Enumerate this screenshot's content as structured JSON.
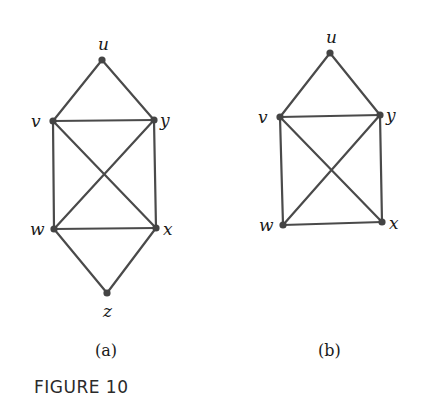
{
  "figure": {
    "caption": "FIGURE 10",
    "graphs": [
      {
        "id": "a",
        "label": "(a)",
        "vertices": [
          {
            "name": "u",
            "x": 102,
            "y": 60
          },
          {
            "name": "v",
            "x": 53,
            "y": 121
          },
          {
            "name": "y",
            "x": 154,
            "y": 120
          },
          {
            "name": "w",
            "x": 54,
            "y": 229
          },
          {
            "name": "x",
            "x": 156,
            "y": 228
          },
          {
            "name": "z",
            "x": 107,
            "y": 293
          }
        ],
        "edges": [
          [
            "u",
            "v"
          ],
          [
            "u",
            "y"
          ],
          [
            "v",
            "y"
          ],
          [
            "v",
            "w"
          ],
          [
            "v",
            "x"
          ],
          [
            "y",
            "w"
          ],
          [
            "y",
            "x"
          ],
          [
            "w",
            "x"
          ],
          [
            "w",
            "z"
          ],
          [
            "x",
            "z"
          ]
        ]
      },
      {
        "id": "b",
        "label": "(b)",
        "vertices": [
          {
            "name": "u",
            "x": 330,
            "y": 53
          },
          {
            "name": "v",
            "x": 280,
            "y": 117
          },
          {
            "name": "y",
            "x": 380,
            "y": 115
          },
          {
            "name": "w",
            "x": 283,
            "y": 225
          },
          {
            "name": "x",
            "x": 382,
            "y": 222
          }
        ],
        "edges": [
          [
            "u",
            "v"
          ],
          [
            "u",
            "y"
          ],
          [
            "v",
            "y"
          ],
          [
            "v",
            "w"
          ],
          [
            "v",
            "x"
          ],
          [
            "y",
            "w"
          ],
          [
            "y",
            "x"
          ],
          [
            "w",
            "x"
          ]
        ]
      }
    ]
  }
}
